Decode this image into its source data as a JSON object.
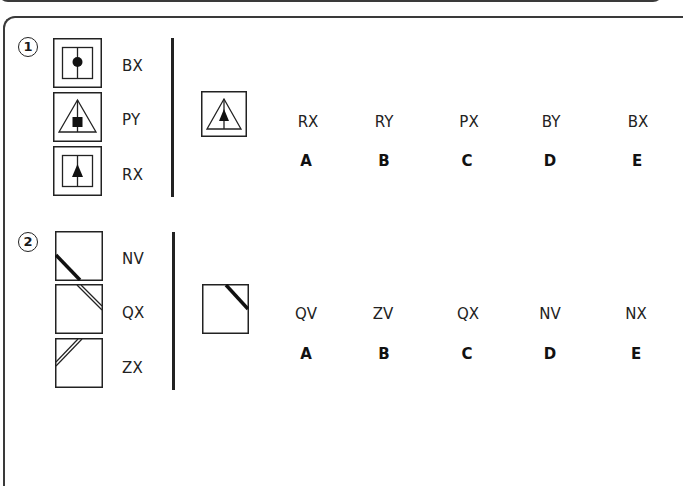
{
  "questions": [
    {
      "number": "1",
      "examples": [
        {
          "figure": "square-with-vertical-line-and-circle",
          "code": "BX"
        },
        {
          "figure": "triangle-with-vertical-line-and-square",
          "code": "PY"
        },
        {
          "figure": "square-with-vertical-line-and-triangle",
          "code": "RX"
        }
      ],
      "target_figure": "triangle-with-vertical-line-and-triangle",
      "options": [
        {
          "code": "RX",
          "letter": "A"
        },
        {
          "code": "RY",
          "letter": "B"
        },
        {
          "code": "PX",
          "letter": "C"
        },
        {
          "code": "BY",
          "letter": "D"
        },
        {
          "code": "BX",
          "letter": "E"
        }
      ]
    },
    {
      "number": "2",
      "examples": [
        {
          "figure": "thick-diagonal-line-lower-left",
          "code": "NV"
        },
        {
          "figure": "double-diagonal-line-lower-right",
          "code": "QX"
        },
        {
          "figure": "double-diagonal-line-upper-left",
          "code": "ZX"
        }
      ],
      "target_figure": "thick-diagonal-line-upper-right",
      "options": [
        {
          "code": "QV",
          "letter": "A"
        },
        {
          "code": "ZV",
          "letter": "B"
        },
        {
          "code": "QX",
          "letter": "C"
        },
        {
          "code": "NV",
          "letter": "D"
        },
        {
          "code": "NX",
          "letter": "E"
        }
      ]
    }
  ],
  "colors": {
    "line": "#222222",
    "border": "#3a3a3a",
    "background": "#ffffff"
  }
}
